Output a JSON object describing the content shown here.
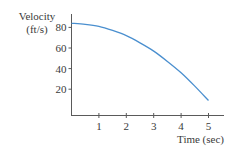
{
  "chart_data": {
    "type": "line",
    "title": "",
    "ylabel_line1": "Velocity",
    "ylabel_line2": "(ft/s)",
    "xlabel": "Time (sec)",
    "x_ticks": [
      1,
      2,
      3,
      4,
      5
    ],
    "y_ticks": [
      20,
      40,
      60,
      80
    ],
    "xlim": [
      0,
      5.5
    ],
    "ylim": [
      0,
      95
    ],
    "grid": false,
    "legend": null,
    "series": [
      {
        "name": "Velocity",
        "color": "#4a8fcf",
        "x": [
          0,
          0.5,
          1,
          1.5,
          2,
          2.5,
          3,
          3.5,
          4,
          4.5,
          5
        ],
        "y": [
          84,
          83,
          81,
          77,
          72,
          65,
          57,
          47,
          36,
          23,
          9
        ]
      }
    ]
  },
  "colors": {
    "axis": "#5a5a5a",
    "curve": "#4a8fcf",
    "text": "#3a3a3a"
  }
}
